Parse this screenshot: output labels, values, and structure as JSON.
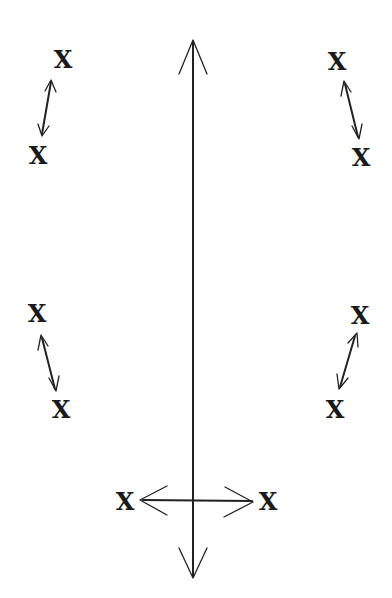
{
  "diagram": {
    "type": "movement-diagram",
    "background": "#ffffff",
    "ink_color": "#222222",
    "marks": [
      {
        "id": "top-left-upper",
        "label": "X",
        "x": 63,
        "y": 60
      },
      {
        "id": "top-left-lower",
        "label": "X",
        "x": 38,
        "y": 156
      },
      {
        "id": "top-right-upper",
        "label": "X",
        "x": 337,
        "y": 62
      },
      {
        "id": "top-right-lower",
        "label": "X",
        "x": 361,
        "y": 158
      },
      {
        "id": "mid-left-upper",
        "label": "X",
        "x": 37,
        "y": 314
      },
      {
        "id": "mid-left-lower",
        "label": "X",
        "x": 61,
        "y": 410
      },
      {
        "id": "mid-right-upper",
        "label": "X",
        "x": 360,
        "y": 316
      },
      {
        "id": "mid-right-lower",
        "label": "X",
        "x": 335,
        "y": 410
      },
      {
        "id": "bottom-left",
        "label": "X",
        "x": 125,
        "y": 502
      },
      {
        "id": "bottom-right",
        "label": "X",
        "x": 268,
        "y": 502
      }
    ],
    "arrows": [
      {
        "id": "vertical-axis",
        "kind": "double-headed",
        "from": [
          193,
          40
        ],
        "to": [
          193,
          578
        ]
      },
      {
        "id": "horizontal-bottom",
        "kind": "double-headed",
        "from": [
          140,
          500
        ],
        "to": [
          253,
          500
        ]
      },
      {
        "id": "top-left-pair",
        "kind": "double-headed",
        "from": [
          50,
          80
        ],
        "to": [
          42,
          136
        ]
      },
      {
        "id": "top-right-pair",
        "kind": "double-headed",
        "from": [
          345,
          82
        ],
        "to": [
          359,
          138
        ]
      },
      {
        "id": "mid-left-pair",
        "kind": "double-headed",
        "from": [
          42,
          336
        ],
        "to": [
          56,
          390
        ]
      },
      {
        "id": "mid-right-pair",
        "kind": "double-headed",
        "from": [
          355,
          334
        ],
        "to": [
          340,
          388
        ]
      }
    ]
  }
}
